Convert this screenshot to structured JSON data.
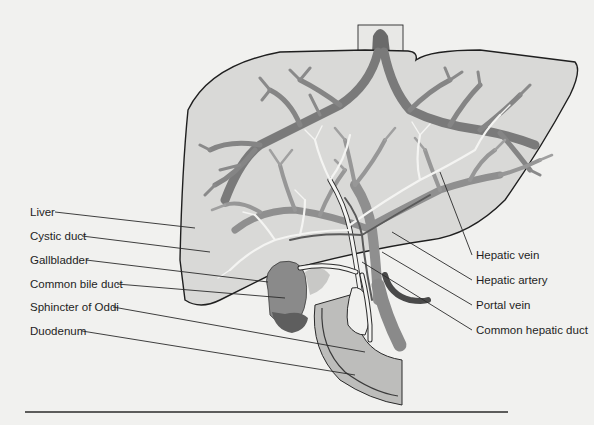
{
  "figure": {
    "labels_left": [
      {
        "id": "liver",
        "text": "Liver"
      },
      {
        "id": "cystic-duct",
        "text": "Cystic duct"
      },
      {
        "id": "gallbladder",
        "text": "Gallbladder"
      },
      {
        "id": "common-bile-duct",
        "text": "Common bile duct"
      },
      {
        "id": "sphincter-of-oddi",
        "text": "Sphincter of Oddi"
      },
      {
        "id": "duodenum",
        "text": "Duodenum"
      }
    ],
    "labels_right": [
      {
        "id": "hepatic-vein",
        "text": "Hepatic vein"
      },
      {
        "id": "hepatic-artery",
        "text": "Hepatic artery"
      },
      {
        "id": "portal-vein",
        "text": "Portal vein"
      },
      {
        "id": "common-hepatic-duct",
        "text": "Common hepatic duct"
      }
    ],
    "colors": {
      "background": "#f1f1ef",
      "liver_fill": "#d9d9d7",
      "vessel_dark": "#7a7a7a",
      "vessel_mid": "#8f8f8f",
      "duct_white": "#f4f4f2",
      "gallbladder": "#8a8a8a",
      "gallbladder_dark": "#5e5e5e",
      "artery_dark": "#4a4a4a",
      "duodenum_fill": "#bdbdbb",
      "outline": "#1f1f1f"
    }
  }
}
